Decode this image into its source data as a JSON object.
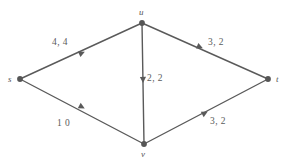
{
  "figure": {
    "kind": "flow-network-graph",
    "background_color": "#ffffff",
    "stroke_color": "#5a5a5a",
    "node_fill_color": "#565656",
    "label_color": "#555555"
  },
  "nodes": [
    {
      "id": "s",
      "label": "s",
      "x": 20,
      "y": 79,
      "label_x": 8,
      "label_y": 75
    },
    {
      "id": "u",
      "label": "u",
      "x": 142,
      "y": 23,
      "label_x": 139,
      "label_y": 8
    },
    {
      "id": "v",
      "label": "v",
      "x": 144,
      "y": 144,
      "label_x": 141,
      "label_y": 150
    },
    {
      "id": "t",
      "label": "t",
      "x": 268,
      "y": 79,
      "label_x": 276,
      "label_y": 75
    }
  ],
  "edges": [
    {
      "id": "s-u",
      "from": "s",
      "to": "u",
      "label": "4, 4",
      "capacity": 4,
      "flow": 4,
      "label_x": 52,
      "label_y": 38,
      "arrow_x": 82,
      "arrow_y": 53
    },
    {
      "id": "s-v",
      "from": "s",
      "to": "v",
      "label": "1  0",
      "capacity": 1,
      "flow": 0,
      "label_x": 57,
      "label_y": 119,
      "arrow_x": 82,
      "arrow_y": 107
    },
    {
      "id": "u-v",
      "from": "u",
      "to": "v",
      "label": "2, 2",
      "capacity": 2,
      "flow": 2,
      "label_x": 147,
      "label_y": 74,
      "arrow_x": 143,
      "arrow_y": 80
    },
    {
      "id": "u-t",
      "from": "u",
      "to": "t",
      "label": "3, 2",
      "capacity": 3,
      "flow": 2,
      "label_x": 208,
      "label_y": 38,
      "arrow_x": 200,
      "arrow_y": 47
    },
    {
      "id": "v-t",
      "from": "v",
      "to": "t",
      "label": "3, 2",
      "capacity": 3,
      "flow": 2,
      "label_x": 210,
      "label_y": 117,
      "arrow_x": 205,
      "arrow_y": 113
    }
  ]
}
